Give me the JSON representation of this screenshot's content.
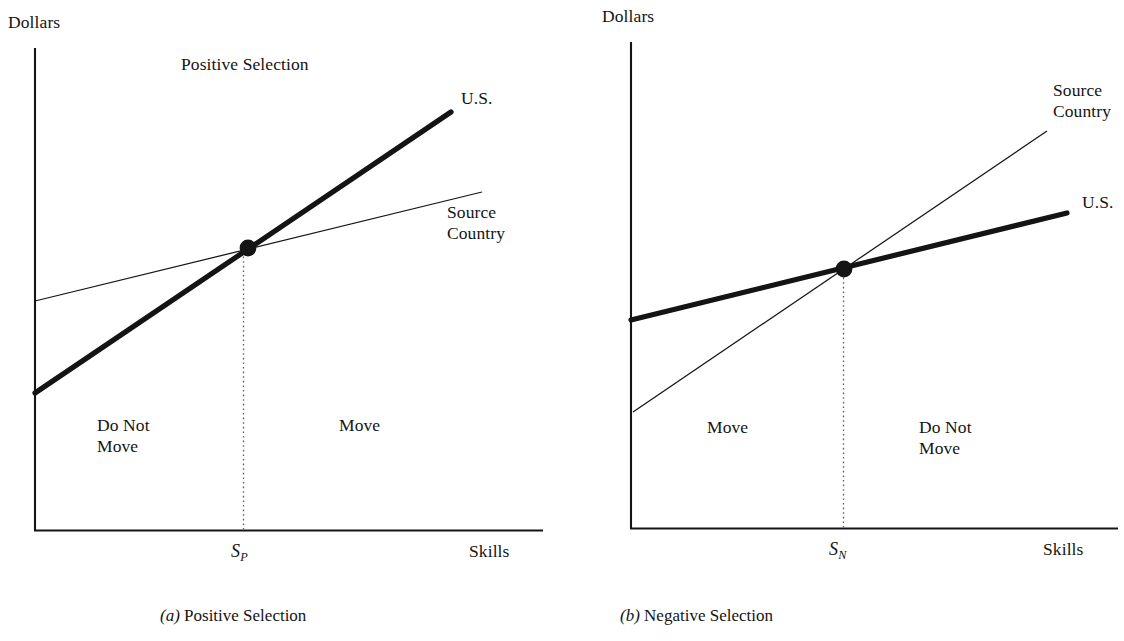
{
  "figure": {
    "background_color": "#ffffff",
    "ink_color": "#141414",
    "panels": [
      {
        "id": "a",
        "caption_mark": "(a)",
        "caption_text": " Positive Selection",
        "title": "Positive Selection",
        "y_axis_label": "Dollars",
        "x_axis_label": "Skills",
        "tick_label_base": "S",
        "tick_label_sub": "P",
        "series": [
          {
            "name": "U.S.",
            "label": "U.S.",
            "style": "thick"
          },
          {
            "name": "Source Country",
            "label_line1": "Source",
            "label_line2": "Country",
            "style": "thin"
          }
        ],
        "regions": [
          {
            "label_line1": "Do Not",
            "label_line2": "Move",
            "side": "left"
          },
          {
            "label_line1": "Move",
            "label_line2": "",
            "side": "right"
          }
        ]
      },
      {
        "id": "b",
        "caption_mark": "(b)",
        "caption_text": " Negative Selection",
        "title": "",
        "y_axis_label": "Dollars",
        "x_axis_label": "Skills",
        "tick_label_base": "S",
        "tick_label_sub": "N",
        "series": [
          {
            "name": "Source Country",
            "label_line1": "Source",
            "label_line2": "Country",
            "style": "thin"
          },
          {
            "name": "U.S.",
            "label": "U.S.",
            "style": "thick"
          }
        ],
        "regions": [
          {
            "label_line1": "Move",
            "label_line2": "",
            "side": "left"
          },
          {
            "label_line1": "Do Not",
            "label_line2": "Move",
            "side": "right"
          }
        ]
      }
    ]
  },
  "chart_data": {
    "type": "line",
    "xlabel": "Skills",
    "ylabel": "Dollars",
    "grid": false,
    "legend": "inline-endpoint-labels",
    "panels": [
      {
        "id": "a",
        "name": "Positive Selection",
        "xlim": [
          0,
          100
        ],
        "ylim": [
          0,
          100
        ],
        "series": [
          {
            "name": "U.S.",
            "style": "thick",
            "x": [
              0,
              86
            ],
            "y": [
              28.4,
              87.1
            ],
            "description": "Steep upward earnings-skill line for the U.S."
          },
          {
            "name": "Source Country",
            "style": "thin",
            "x": [
              0,
              92.6
            ],
            "y": [
              47.6,
              70.2
            ],
            "description": "Flatter upward earnings-skill line for the source country"
          }
        ],
        "intersection": {
          "x": 43.0,
          "y": 58.6,
          "tick": "S_P",
          "marker": "filled-circle"
        },
        "regions": [
          {
            "label": "Do Not Move",
            "x_range": [
              0,
              43.0
            ]
          },
          {
            "label": "Move",
            "x_range": [
              43.0,
              100
            ]
          }
        ]
      },
      {
        "id": "b",
        "name": "Negative Selection",
        "xlim": [
          0,
          100
        ],
        "ylim": [
          0,
          100
        ],
        "series": [
          {
            "name": "U.S.",
            "style": "thick",
            "x": [
              0,
              89.5
            ],
            "y": [
              43.5,
              65.8
            ],
            "description": "Flatter upward earnings-skill line for the U.S."
          },
          {
            "name": "Source Country",
            "style": "thin",
            "x": [
              0.4,
              85.4
            ],
            "y": [
              24.2,
              82.7
            ],
            "description": "Steep upward earnings-skill line for the source country"
          }
        ],
        "intersection": {
          "x": 43.7,
          "y": 54.2,
          "tick": "S_N",
          "marker": "filled-circle"
        },
        "regions": [
          {
            "label": "Move",
            "x_range": [
              0,
              43.7
            ]
          },
          {
            "label": "Do Not Move",
            "x_range": [
              43.7,
              100
            ]
          }
        ]
      }
    ]
  }
}
